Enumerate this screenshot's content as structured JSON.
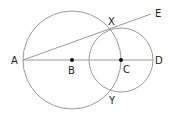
{
  "colors": {
    "line": "#9a9a9a",
    "point": "#111111",
    "label": "#222222"
  },
  "points": {
    "A": {
      "label": "A",
      "x": 23,
      "y": 60
    },
    "B": {
      "label": "B",
      "x": 72,
      "y": 60
    },
    "C": {
      "label": "C",
      "x": 121,
      "y": 60
    },
    "D": {
      "label": "D",
      "x": 153,
      "y": 60
    },
    "E": {
      "label": "E",
      "x": 151,
      "y": 14
    },
    "X": {
      "label": "X",
      "x": 110,
      "y": 29
    },
    "Y": {
      "label": "Y",
      "x": 110,
      "y": 92
    }
  },
  "circles": [
    {
      "name": "circle-centered-B",
      "cx": 72,
      "cy": 60,
      "r": 49
    },
    {
      "name": "circle-centered-C",
      "cx": 121,
      "cy": 60,
      "r": 32
    }
  ],
  "segments": [
    {
      "name": "segment-AD",
      "from": "A",
      "to": "D"
    },
    {
      "name": "segment-AE",
      "from": "A",
      "to": "E"
    }
  ],
  "labels": {
    "A": "A",
    "B": "B",
    "C": "C",
    "D": "D",
    "E": "E",
    "X": "X",
    "Y": "Y"
  }
}
